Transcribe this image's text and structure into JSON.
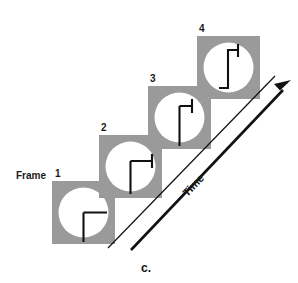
{
  "figure": {
    "caption": "c.",
    "frame_word": "Frame",
    "time_axis_label": "Time",
    "background_color": "#ffffff",
    "frame_fill_color": "#9a9a9a",
    "circle_color": "#ffffff",
    "stroke_color": "#111111",
    "frames": [
      {
        "number": "1",
        "label_x": 75,
        "label_y": 176,
        "x": 52,
        "y": 181,
        "size": 63,
        "hand_state": "right-angle-elbow",
        "description": "Clock hand shown as vertical segment from center down, with horizontal segment from center to the right"
      },
      {
        "number": "2",
        "label_x": 101,
        "label_y": 131,
        "x": 99,
        "y": 135,
        "size": 63,
        "hand_state": "elbow-with-upward-tick",
        "description": "Vertical segment downward, horizontal segment right, small upward tick at the right end"
      },
      {
        "number": "3",
        "label_x": 150,
        "label_y": 82,
        "x": 148,
        "y": 86,
        "size": 63,
        "hand_state": "vertical-with-upward-tick",
        "description": "Long vertical segment with a short horizontal top and an upward tick"
      },
      {
        "number": "4",
        "label_x": 199,
        "label_y": 32,
        "x": 197,
        "y": 36,
        "size": 63,
        "hand_state": "s-step-with-upward-tick",
        "description": "Step / z shape: top horizontal to the right with upward tick, down, then bottom horizontal to the left"
      }
    ],
    "time_arrow": {
      "thin_line": {
        "x1": 108,
        "y1": 248,
        "x2": 274,
        "y2": 76
      },
      "thick_line": {
        "x1": 130,
        "y1": 250,
        "x2": 288,
        "y2": 85
      },
      "label_rotation_deg": -46,
      "label_x": 196,
      "label_y": 188
    },
    "caption_x": 146,
    "caption_y": 270
  }
}
